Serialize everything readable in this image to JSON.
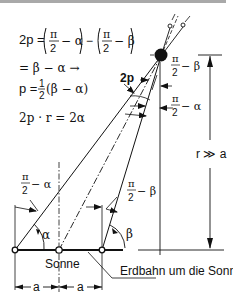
{
  "equations": {
    "line1_lhs": "2p =",
    "pi": "π",
    "two": "2",
    "minus_alpha": "− α",
    "minus_beta": "− β",
    "minus": "−",
    "line2": "= β − α  →",
    "line3_lhs": "p =",
    "line3_one": "1",
    "line3_two": "2",
    "line3_rhs": "(β − α)",
    "line4": "2p · r = 2α"
  },
  "labels": {
    "parallax": "2p",
    "pi_half_minus_beta_top": "π",
    "two_top": "2",
    "minus_beta_top": "− β",
    "pi_half_minus_alpha_right": "π",
    "two_right": "2",
    "minus_alpha_right": "− α",
    "pi_half_minus_alpha_left": "π",
    "two_left": "2",
    "minus_alpha_left": "− α",
    "pi_half_minus_beta_mid": "π",
    "two_mid": "2",
    "minus_beta_mid": "− β",
    "alpha": "α",
    "beta": "β",
    "distance": "r ≫ a",
    "sun": "Sonne",
    "orbit": "Erdbahn um die Sonne",
    "a_left": "a",
    "a_right": "a"
  },
  "colors": {
    "ink": "#111111",
    "topbar": "#a9a9a9"
  }
}
